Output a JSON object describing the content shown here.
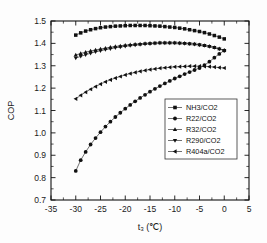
{
  "chart_data": {
    "type": "line",
    "title": "",
    "xlabel": "t₃ (℃)",
    "ylabel": "COP",
    "xlim": [
      -35,
      5
    ],
    "ylim": [
      0.7,
      1.5
    ],
    "xticks": [
      "-35",
      "-30",
      "-25",
      "-20",
      "-15",
      "-10",
      "-5",
      "0",
      "5"
    ],
    "xtick_values": [
      -35,
      -30,
      -25,
      -20,
      -15,
      -10,
      -5,
      0,
      5
    ],
    "yticks": [
      "0.7",
      "0.8",
      "0.9",
      "1.0",
      "1.1",
      "1.2",
      "1.3",
      "1.4",
      "1.5"
    ],
    "ytick_values": [
      0.7,
      0.8,
      0.9,
      1.0,
      1.1,
      1.2,
      1.3,
      1.4,
      1.5
    ],
    "grid": false,
    "legend_position": "lower-right-inside",
    "x": [
      -30,
      -29,
      -28,
      -27,
      -26,
      -25,
      -24,
      -23,
      -22,
      -21,
      -20,
      -19,
      -18,
      -17,
      -16,
      -15,
      -14,
      -13,
      -12,
      -11,
      -10,
      -9,
      -8,
      -7,
      -6,
      -5,
      -4,
      -3,
      -2,
      -1,
      0
    ],
    "series": [
      {
        "name": "NH3/CO2",
        "marker": "square",
        "values": [
          1.437,
          1.447,
          1.455,
          1.461,
          1.466,
          1.47,
          1.473,
          1.475,
          1.477,
          1.478,
          1.479,
          1.48,
          1.48,
          1.48,
          1.48,
          1.479,
          1.478,
          1.477,
          1.475,
          1.473,
          1.471,
          1.468,
          1.465,
          1.461,
          1.457,
          1.453,
          1.448,
          1.442,
          1.435,
          1.428,
          1.42
        ]
      },
      {
        "name": "R22/CO2",
        "marker": "circle",
        "values": [
          0.83,
          0.878,
          0.915,
          0.948,
          0.977,
          1.003,
          1.028,
          1.05,
          1.071,
          1.09,
          1.108,
          1.125,
          1.141,
          1.156,
          1.17,
          1.184,
          1.197,
          1.209,
          1.221,
          1.232,
          1.243,
          1.253,
          1.263,
          1.272,
          1.281,
          1.29,
          1.303,
          1.318,
          1.336,
          1.353,
          1.368
        ]
      },
      {
        "name": "R32/CO2",
        "marker": "triangle-up",
        "values": [
          1.348,
          1.355,
          1.361,
          1.366,
          1.371,
          1.375,
          1.379,
          1.383,
          1.386,
          1.389,
          1.392,
          1.394,
          1.396,
          1.398,
          1.4,
          1.401,
          1.402,
          1.403,
          1.403,
          1.403,
          1.403,
          1.402,
          1.401,
          1.399,
          1.397,
          1.394,
          1.391,
          1.387,
          1.382,
          1.376,
          1.37
        ]
      },
      {
        "name": "R290/CO2",
        "marker": "triangle-down",
        "values": [
          1.334,
          1.342,
          1.349,
          1.356,
          1.362,
          1.367,
          1.372,
          1.376,
          1.38,
          1.384,
          1.387,
          1.39,
          1.392,
          1.395,
          1.397,
          1.398,
          1.4,
          1.401,
          1.401,
          1.401,
          1.401,
          1.4,
          1.399,
          1.398,
          1.396,
          1.393,
          1.39,
          1.386,
          1.381,
          1.375,
          1.368
        ]
      },
      {
        "name": "R404a/CO2",
        "marker": "triangle-left",
        "values": [
          1.152,
          1.168,
          1.182,
          1.195,
          1.207,
          1.218,
          1.228,
          1.237,
          1.245,
          1.252,
          1.259,
          1.265,
          1.27,
          1.275,
          1.279,
          1.283,
          1.286,
          1.289,
          1.291,
          1.293,
          1.295,
          1.296,
          1.297,
          1.298,
          1.298,
          1.298,
          1.297,
          1.296,
          1.294,
          1.292,
          1.29
        ]
      }
    ]
  },
  "legend": {
    "items": [
      {
        "label": "NH3/CO2"
      },
      {
        "label": "R22/CO2"
      },
      {
        "label": "R32/CO2"
      },
      {
        "label": "R290/CO2"
      },
      {
        "label": "R404a/CO2"
      }
    ]
  }
}
